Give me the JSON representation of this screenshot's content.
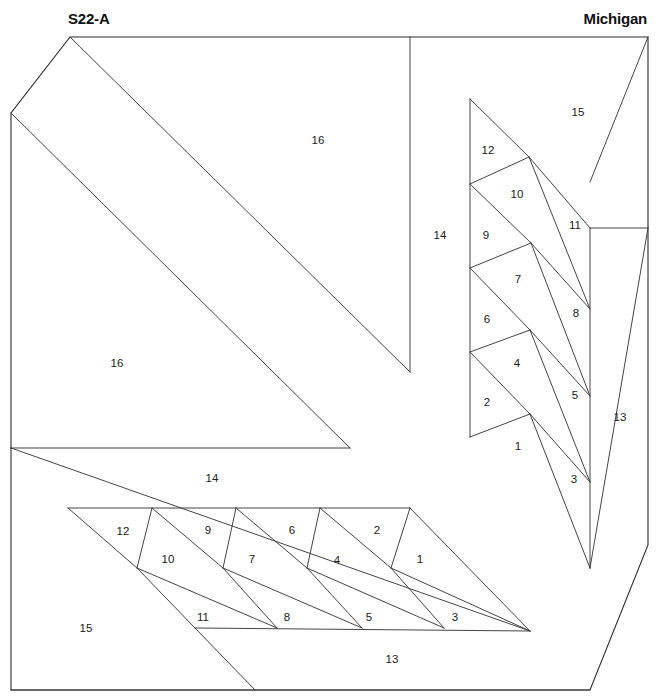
{
  "header": {
    "block_code": "S22-A",
    "block_name": "Michigan"
  },
  "style": {
    "line_color": "#2b2b2b",
    "seam_color": "#3a3a3a",
    "background": "#ffffff",
    "label_color": "#1a1a1a"
  },
  "diagram": {
    "type": "foundation-piecing-pattern",
    "piece_count": 16,
    "units": [
      {
        "name": "upper-right-unit",
        "pieces": [
          1,
          2,
          3,
          4,
          5,
          6,
          7,
          8,
          9,
          10,
          11,
          12,
          13,
          14,
          15,
          16
        ]
      },
      {
        "name": "lower-left-unit",
        "pieces": [
          1,
          2,
          3,
          4,
          5,
          6,
          7,
          8,
          9,
          10,
          11,
          12,
          13,
          14,
          15,
          16
        ]
      }
    ],
    "labels_upper": [
      {
        "id": "u16a",
        "text": "16",
        "x": 318,
        "y": 141
      },
      {
        "id": "u16b",
        "text": "16",
        "x": 117,
        "y": 364
      },
      {
        "id": "u15",
        "text": "15",
        "x": 578,
        "y": 113
      },
      {
        "id": "u14",
        "text": "14",
        "x": 440,
        "y": 236
      },
      {
        "id": "u13",
        "text": "13",
        "x": 620,
        "y": 418
      },
      {
        "id": "u12",
        "text": "12",
        "x": 488,
        "y": 151
      },
      {
        "id": "u11",
        "text": "11",
        "x": 575,
        "y": 226
      },
      {
        "id": "u10",
        "text": "10",
        "x": 517,
        "y": 195
      },
      {
        "id": "u9",
        "text": "9",
        "x": 486,
        "y": 236
      },
      {
        "id": "u8",
        "text": "8",
        "x": 576,
        "y": 314
      },
      {
        "id": "u7",
        "text": "7",
        "x": 518,
        "y": 280
      },
      {
        "id": "u6",
        "text": "6",
        "x": 487,
        "y": 320
      },
      {
        "id": "u5",
        "text": "5",
        "x": 575,
        "y": 396
      },
      {
        "id": "u4",
        "text": "4",
        "x": 517,
        "y": 364
      },
      {
        "id": "u2",
        "text": "2",
        "x": 487,
        "y": 403
      },
      {
        "id": "u1",
        "text": "1",
        "x": 518,
        "y": 447
      },
      {
        "id": "u3",
        "text": "3",
        "x": 574,
        "y": 480
      }
    ],
    "labels_lower": [
      {
        "id": "l14",
        "text": "14",
        "x": 212,
        "y": 479
      },
      {
        "id": "l15",
        "text": "15",
        "x": 86,
        "y": 629
      },
      {
        "id": "l13",
        "text": "13",
        "x": 392,
        "y": 660
      },
      {
        "id": "l12",
        "text": "12",
        "x": 123,
        "y": 532
      },
      {
        "id": "l10",
        "text": "10",
        "x": 168,
        "y": 560
      },
      {
        "id": "l9",
        "text": "9",
        "x": 208,
        "y": 531
      },
      {
        "id": "l7",
        "text": "7",
        "x": 252,
        "y": 560
      },
      {
        "id": "l6",
        "text": "6",
        "x": 292,
        "y": 531
      },
      {
        "id": "l4",
        "text": "4",
        "x": 337,
        "y": 561
      },
      {
        "id": "l2",
        "text": "2",
        "x": 377,
        "y": 531
      },
      {
        "id": "l1",
        "text": "1",
        "x": 420,
        "y": 560
      },
      {
        "id": "l11",
        "text": "11",
        "x": 203,
        "y": 618
      },
      {
        "id": "l8",
        "text": "8",
        "x": 287,
        "y": 618
      },
      {
        "id": "l5",
        "text": "5",
        "x": 369,
        "y": 618
      },
      {
        "id": "l3",
        "text": "3",
        "x": 455,
        "y": 618
      }
    ],
    "outline_paths": [
      "M 70 37 L 648 37 L 648 545 L 590 690 L 11 690 L 11 113 Z"
    ],
    "seam_paths": [
      "M 70 37 L 410 372",
      "M 11 113 L 350 448",
      "M 11 448 L 350 448",
      "M 410 37 L 410 372",
      "M 470 99 L 470 437",
      "M 470 99 L 529 157",
      "M 470 184 L 529 157",
      "M 470 184 L 531 243",
      "M 470 268 L 531 243",
      "M 470 268 L 530 330",
      "M 470 352 L 530 330",
      "M 470 352 L 530 414",
      "M 470 437 L 530 414",
      "M 529 157 L 590 228",
      "M 529 157 L 590 309",
      "M 531 243 L 590 309",
      "M 531 243 L 590 396",
      "M 530 330 L 590 396",
      "M 530 330 L 590 482",
      "M 530 414 L 590 482",
      "M 530 414 L 590 568",
      "M 590 228 L 590 568",
      "M 648 37 L 590 182",
      "M 590 228 L 648 228",
      "M 648 228 L 590 568",
      "M 11 448 L 530 631",
      "M 68 508 L 410 508",
      "M 68 508 L 137 568",
      "M 137 568 L 152 508",
      "M 152 508 L 223 568",
      "M 223 568 L 236 508",
      "M 236 508 L 307 568",
      "M 307 568 L 320 508",
      "M 320 508 L 391 568",
      "M 391 568 L 410 508",
      "M 137 568 L 195 628",
      "M 137 568 L 277 628",
      "M 223 568 L 277 628",
      "M 223 568 L 362 628",
      "M 307 568 L 362 628",
      "M 307 568 L 444 628",
      "M 391 568 L 444 628",
      "M 391 568 L 530 631",
      "M 195 628 L 530 631",
      "M 410 508 L 530 631",
      "M 11 690 L 590 690",
      "M 195 628 L 255 690"
    ]
  }
}
